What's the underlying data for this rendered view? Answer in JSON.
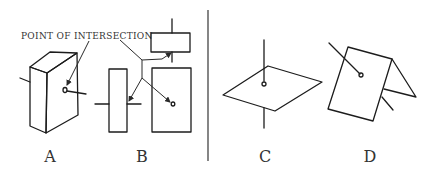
{
  "figure": {
    "caption_text": "POINT OF INTERSECTION",
    "panels": [
      {
        "id": "A",
        "label": "A",
        "description": "Line intersecting a rectangular solid (box)"
      },
      {
        "id": "B",
        "label": "B",
        "description": "Line intersecting planes shown in orthographic views"
      },
      {
        "id": "C",
        "label": "C",
        "description": "Vertical line piercing an oblique plane"
      },
      {
        "id": "D",
        "label": "D",
        "description": "Line piercing a folded (bent) plane"
      }
    ],
    "colors": {
      "line": "#1c1c1c",
      "text": "#333333",
      "background": "#ffffff"
    }
  }
}
